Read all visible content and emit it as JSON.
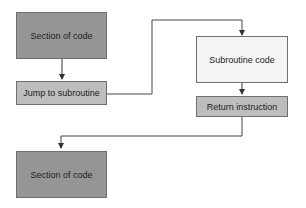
{
  "diagram": {
    "nodes": [
      {
        "id": "section1",
        "label": "Section of code"
      },
      {
        "id": "jump",
        "label": "Jump to subroutine"
      },
      {
        "id": "subroutine",
        "label": "Subroutine code"
      },
      {
        "id": "return",
        "label": "Return instruction"
      },
      {
        "id": "section2",
        "label": "Section of code"
      }
    ],
    "edges": [
      {
        "from": "section1",
        "to": "jump"
      },
      {
        "from": "jump",
        "to": "subroutine"
      },
      {
        "from": "subroutine",
        "to": "return"
      },
      {
        "from": "return",
        "to": "section2"
      }
    ],
    "colors": {
      "dark_fill": "#959595",
      "mid_fill": "#bdbdbd",
      "light_fill": "#f4f4f4",
      "line": "#333333"
    }
  }
}
